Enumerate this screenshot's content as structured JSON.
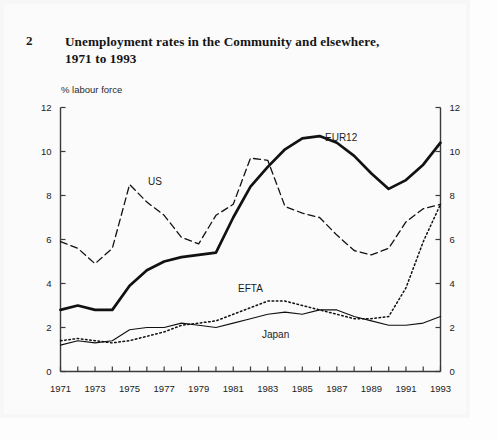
{
  "figure": {
    "number": "2",
    "title_line1": "Unemployment rates in the Community and elsewhere,",
    "title_line2": "1971 to 1993"
  },
  "axis": {
    "y_unit_caption": "% labour force",
    "y_ticks": [
      "0",
      "2",
      "4",
      "6",
      "8",
      "10",
      "12"
    ],
    "x_ticks": [
      "1971",
      "1973",
      "1975",
      "1977",
      "1979",
      "1981",
      "1983",
      "1985",
      "1987",
      "1989",
      "1991",
      "1993"
    ]
  },
  "series_labels": {
    "eur12": "EUR12",
    "us": "US",
    "efta": "EFTA",
    "japan": "Japan"
  },
  "colors": {
    "line": "#111111",
    "axis": "#3a3a3a",
    "background": "#fbfbfb"
  },
  "chart_data": {
    "type": "line",
    "title": "Unemployment rates in the Community and elsewhere, 1971 to 1993",
    "xlabel": "",
    "ylabel": "% labour force",
    "xlim": [
      1971,
      1993
    ],
    "ylim": [
      0,
      12
    ],
    "grid": false,
    "legend": "inline-annotations",
    "x": [
      1971,
      1972,
      1973,
      1974,
      1975,
      1976,
      1977,
      1978,
      1979,
      1980,
      1981,
      1982,
      1983,
      1984,
      1985,
      1986,
      1987,
      1988,
      1989,
      1990,
      1991,
      1992,
      1993
    ],
    "series": [
      {
        "name": "EUR12",
        "style": "solid-thick",
        "values": [
          2.8,
          3.0,
          2.8,
          2.8,
          3.9,
          4.6,
          5.0,
          5.2,
          5.3,
          5.4,
          7.0,
          8.4,
          9.3,
          10.1,
          10.6,
          10.7,
          10.4,
          9.8,
          9.0,
          8.3,
          8.7,
          9.4,
          10.4
        ]
      },
      {
        "name": "US",
        "style": "dashed",
        "values": [
          5.9,
          5.6,
          4.9,
          5.6,
          8.5,
          7.7,
          7.1,
          6.1,
          5.8,
          7.1,
          7.6,
          9.7,
          9.6,
          7.5,
          7.2,
          7.0,
          6.2,
          5.5,
          5.3,
          5.6,
          6.8,
          7.4,
          7.6
        ]
      },
      {
        "name": "EFTA",
        "style": "dotted",
        "values": [
          1.4,
          1.5,
          1.4,
          1.3,
          1.4,
          1.6,
          1.8,
          2.1,
          2.2,
          2.3,
          2.6,
          2.9,
          3.2,
          3.2,
          3.0,
          2.8,
          2.6,
          2.4,
          2.4,
          2.5,
          3.8,
          5.9,
          7.6
        ]
      },
      {
        "name": "Japan",
        "style": "solid-thin",
        "values": [
          1.2,
          1.4,
          1.3,
          1.4,
          1.9,
          2.0,
          2.0,
          2.2,
          2.1,
          2.0,
          2.2,
          2.4,
          2.6,
          2.7,
          2.6,
          2.8,
          2.8,
          2.5,
          2.3,
          2.1,
          2.1,
          2.2,
          2.5
        ]
      }
    ]
  }
}
